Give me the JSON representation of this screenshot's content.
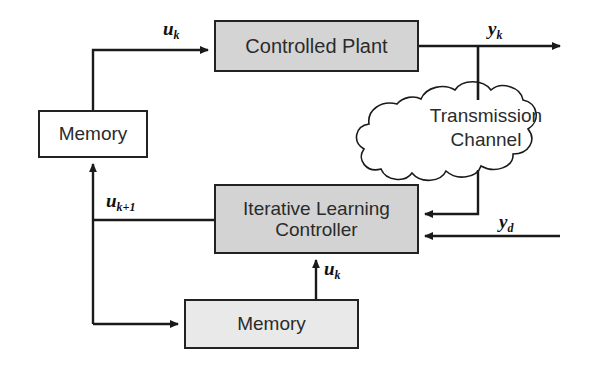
{
  "diagram": {
    "colors": {
      "plant_fill": "#d4d4d4",
      "controller_fill": "#d3d3d3",
      "memory_bottom_fill": "#e9e9e9",
      "memory_top_fill": "#ffffff",
      "line": "#1a1a1a",
      "text": "#2b2b2b"
    },
    "blocks": {
      "plant": {
        "label": "Controlled Plant"
      },
      "controller": {
        "label_line1": "Iterative Learning",
        "label_line2": "Controller"
      },
      "memory_top": {
        "label": "Memory"
      },
      "memory_bottom": {
        "label": "Memory"
      },
      "channel": {
        "label_line1": "Transmission",
        "label_line2": "Channel"
      }
    },
    "signals": {
      "u_k_top": {
        "base": "u",
        "sub": "k"
      },
      "y_k": {
        "base": "y",
        "sub": "k"
      },
      "u_k_plus_1": {
        "base": "u",
        "sub": "k+1"
      },
      "y_d": {
        "base": "y",
        "sub": "d"
      },
      "u_k_mid": {
        "base": "u",
        "sub": "k"
      }
    }
  }
}
